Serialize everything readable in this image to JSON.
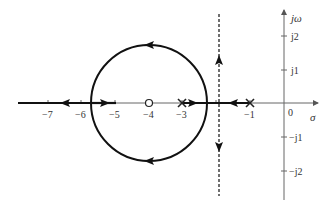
{
  "diagram": {
    "type": "root-locus",
    "axes": {
      "real_label": "σ",
      "imag_label": "jω",
      "origin_label": "0",
      "real_ticks": [
        {
          "value": -7,
          "label": "−7"
        },
        {
          "value": -6,
          "label": "−6"
        },
        {
          "value": -5,
          "label": "−5"
        },
        {
          "value": -4,
          "label": "−4"
        },
        {
          "value": -3,
          "label": "−3"
        },
        {
          "value": -1,
          "label": "−1"
        }
      ],
      "imag_ticks": [
        {
          "value": 2,
          "label": "j2"
        },
        {
          "value": 1,
          "label": "j1"
        },
        {
          "value": -1,
          "label": "−j1"
        },
        {
          "value": -2,
          "label": "−j2"
        }
      ]
    },
    "poles": [
      {
        "re": -3,
        "im": 0,
        "marker": "x"
      },
      {
        "re": -1,
        "im": 0,
        "marker": "x"
      }
    ],
    "zeros": [
      {
        "re": -4,
        "im": 0,
        "marker": "o"
      }
    ],
    "locus": {
      "circle": {
        "center_re": -4,
        "radius": 1.732,
        "direction": "counterclockwise from right breakaway to left break-in"
      },
      "real_axis_segments": [
        {
          "from": -3,
          "to": -2.27,
          "arrow": "right"
        },
        {
          "from": -1,
          "to": -2.27,
          "arrow": "left"
        },
        {
          "from": -5.73,
          "to": -4,
          "arrow": "right"
        },
        {
          "from": -5.73,
          "to": -7.5,
          "arrow": "left"
        }
      ],
      "asymptote": {
        "re": -1.67,
        "style": "dashed",
        "arrows": [
          "up",
          "down"
        ]
      }
    },
    "colors": {
      "locus": "#111111",
      "axis": "#555555",
      "asymptote": "#333333"
    }
  }
}
